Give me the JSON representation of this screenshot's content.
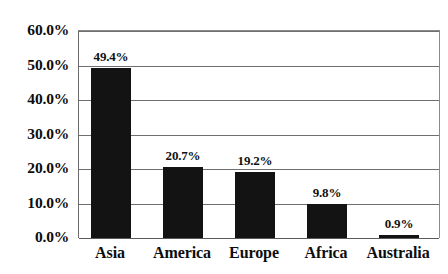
{
  "chart_data": {
    "type": "bar",
    "title": "",
    "subtitle": "",
    "xlabel": "",
    "ylabel": "",
    "categories": [
      "Asia",
      "America",
      "Europe",
      "Africa",
      "Australia"
    ],
    "values": [
      49.4,
      20.7,
      19.2,
      9.8,
      0.9
    ],
    "value_labels": [
      "49.4%",
      "20.7%",
      "19.2%",
      "9.8%",
      "0.9%"
    ],
    "series": [
      {
        "name": "",
        "values": [
          49.4,
          20.7,
          19.2,
          9.8,
          0.9
        ]
      }
    ],
    "ylim": [
      0,
      60
    ],
    "y_ticks": [
      0,
      10,
      20,
      30,
      40,
      50,
      60
    ],
    "y_tick_labels": [
      "0.0%",
      "10.0%",
      "20.0%",
      "30.0%",
      "40.0%",
      "50.0%",
      "60.0%"
    ],
    "grid": true,
    "grid_axis": "y",
    "legend": false,
    "legend_position": "none",
    "bar_color": "#131313",
    "grid_color": "#6f6f6f",
    "axis_color": "#6d6d6d",
    "background_color": "#ffffff",
    "text_color": "#0d0d0d",
    "data_labels_shown": true
  }
}
